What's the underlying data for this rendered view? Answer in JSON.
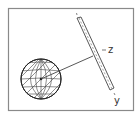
{
  "diagram": {
    "labels": {
      "z": "z",
      "y": "y",
      "center": "c"
    },
    "colors": {
      "stroke": "#444444",
      "frame": "#888888",
      "background": "#ffffff"
    },
    "elements": [
      "frame",
      "meshed-sphere",
      "connector-line",
      "tilted-slab",
      "axis-label-z",
      "axis-label-y"
    ]
  }
}
